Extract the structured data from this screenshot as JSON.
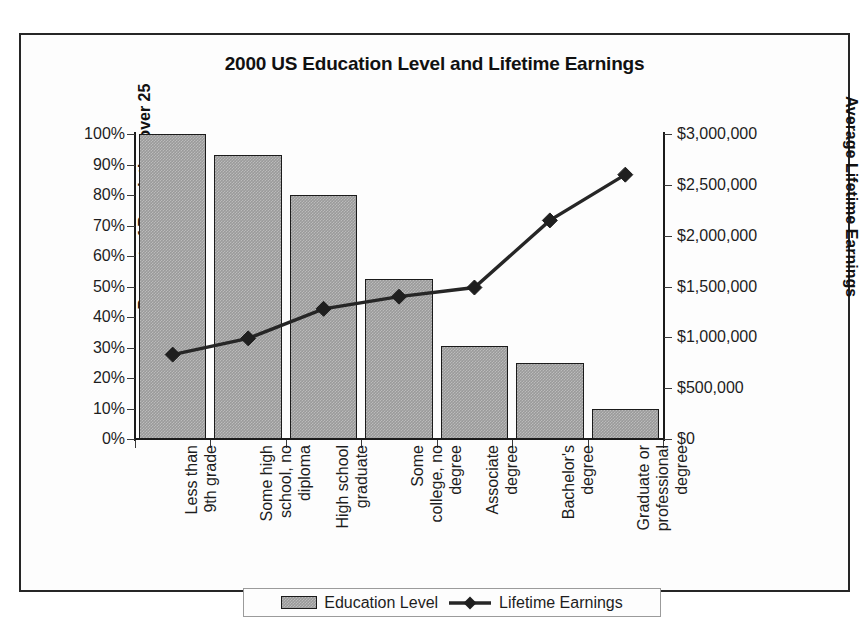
{
  "chart_data": {
    "type": "bar",
    "title": "2000 US Education Level and Lifetime Earnings",
    "xlabel": "",
    "ylabel": "Percent of Population over 25",
    "y2label": "Average Lifetime Earnings",
    "grid": false,
    "legend_position": "bottom",
    "categories": [
      "Less than 9th grade",
      "Some high school, no diploma",
      "High school graduate",
      "Some college, no degree",
      "Associate degree",
      "Bachelor's degree",
      "Graduate or professional degree"
    ],
    "category_lines": [
      "Less than\n9th grade",
      "Some high\nschool, no\ndiploma",
      "High school\ngraduate",
      "Some\ncollege, no\ndegree",
      "Associate\ndegree",
      "Bachelor's\ndegree",
      "Graduate or\nprofessional\ndegree"
    ],
    "series": [
      {
        "name": "Education Level",
        "type": "bar",
        "axis": "left",
        "unit": "percent",
        "values": [
          100,
          93,
          80,
          52.5,
          30.5,
          25,
          10
        ]
      },
      {
        "name": "Lifetime Earnings",
        "type": "line",
        "axis": "right",
        "unit": "dollars",
        "marker": "diamond",
        "values": [
          830000,
          990000,
          1280000,
          1400000,
          1490000,
          2150000,
          2600000
        ]
      }
    ],
    "ylim": [
      0,
      100
    ],
    "yticks": [
      0,
      10,
      20,
      30,
      40,
      50,
      60,
      70,
      80,
      90,
      100
    ],
    "ytick_labels": [
      "0%",
      "10%",
      "20%",
      "30%",
      "40%",
      "50%",
      "60%",
      "70%",
      "80%",
      "90%",
      "100%"
    ],
    "y2lim": [
      0,
      3000000
    ],
    "y2ticks": [
      0,
      500000,
      1000000,
      1500000,
      2000000,
      2500000,
      3000000
    ],
    "y2tick_labels": [
      "$0",
      "$500,000",
      "$1,000,000",
      "$1,500,000",
      "$2,000,000",
      "$2,500,000",
      "$3,000,000"
    ],
    "colors": {
      "bar_fill": "#9a9a9a",
      "bar_border": "#1b1b1b",
      "line": "#262626",
      "marker": "#1f1f1f",
      "axis": "#1b1b1b",
      "text": "#1d1d1d",
      "frame": "#262626",
      "background": "#fdfdfd"
    }
  },
  "legend": {
    "entries": [
      {
        "label": "Education Level",
        "swatch": "bar-swatch"
      },
      {
        "label": "Lifetime Earnings",
        "swatch": "line-diamond-swatch"
      }
    ]
  }
}
